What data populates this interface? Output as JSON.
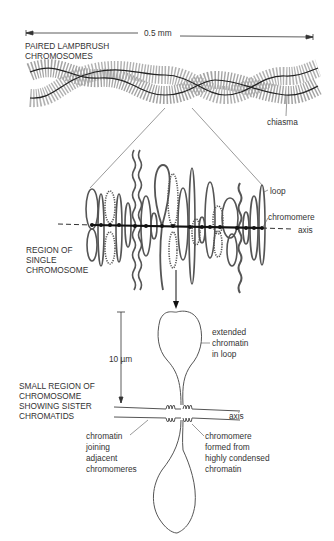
{
  "figure": {
    "top_panel": {
      "scale_label": "0.5 mm",
      "title_line1": "PAIRED LAMPBRUSH",
      "title_line2": "CHROMOSOMES",
      "chiasma_label": "chiasma"
    },
    "middle_panel": {
      "title_line1": "REGION OF",
      "title_line2": "SINGLE",
      "title_line3": "CHROMOSOME",
      "loop_label": "loop",
      "chromomere_label": "chromomere",
      "axis_label": "axis"
    },
    "bottom_panel": {
      "scale_label": "10 µm",
      "title_line1": "SMALL REGION OF",
      "title_line2": "CHROMOSOME",
      "title_line3": "SHOWING SISTER",
      "title_line4": "CHROMATIDS",
      "extended_label_line1": "extended",
      "extended_label_line2": "chromatin",
      "extended_label_line3": "in loop",
      "axis_label": "axis",
      "joining_label_line1": "chromatin",
      "joining_label_line2": "joining",
      "joining_label_line3": "adjacent",
      "joining_label_line4": "chromomeres",
      "chromomere_label_line1": "chromomere",
      "chromomere_label_line2": "formed from",
      "chromomere_label_line3": "highly condensed",
      "chromomere_label_line4": "chromatin"
    },
    "colors": {
      "line": "#333333",
      "loop_fill": "#9a9a9a",
      "text": "#333333"
    }
  }
}
